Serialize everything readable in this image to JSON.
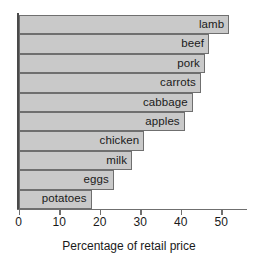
{
  "chart_data": {
    "type": "bar",
    "orientation": "horizontal",
    "title": "",
    "xlabel": "Percentage of retail price",
    "ylabel": "",
    "categories": [
      "lamb",
      "beef",
      "pork",
      "carrots",
      "cabbage",
      "apples",
      "chicken",
      "milk",
      "eggs",
      "potatoes"
    ],
    "values": [
      52,
      47,
      46,
      45,
      43,
      41,
      31,
      28,
      23.5,
      18
    ],
    "xlim": [
      0,
      56
    ],
    "ylim": [
      0,
      10
    ],
    "xticks": [
      0,
      10,
      20,
      30,
      40,
      50
    ],
    "xtick_labels": [
      "0",
      "10",
      "20",
      "30",
      "40",
      "50"
    ],
    "grid": false,
    "legend": null,
    "bar_fill_color": "#c9c9c9",
    "bar_border_color": "#6f6f6f",
    "axis_color": "#4a4a4a",
    "text_color": "#1a1a1a",
    "labels_inside_bars": true
  },
  "axis": {
    "x_title": "Percentage of retail price"
  },
  "bars": [
    {
      "label": "lamb",
      "value": 52
    },
    {
      "label": "beef",
      "value": 47
    },
    {
      "label": "pork",
      "value": 46
    },
    {
      "label": "carrots",
      "value": 45
    },
    {
      "label": "cabbage",
      "value": 43
    },
    {
      "label": "apples",
      "value": 41
    },
    {
      "label": "chicken",
      "value": 31
    },
    {
      "label": "milk",
      "value": 28
    },
    {
      "label": "eggs",
      "value": 23.5
    },
    {
      "label": "potatoes",
      "value": 18
    }
  ],
  "ticks": [
    {
      "value": 0,
      "label": "0"
    },
    {
      "value": 10,
      "label": "10"
    },
    {
      "value": 20,
      "label": "20"
    },
    {
      "value": 30,
      "label": "30"
    },
    {
      "value": 40,
      "label": "40"
    },
    {
      "value": 50,
      "label": "50"
    }
  ]
}
